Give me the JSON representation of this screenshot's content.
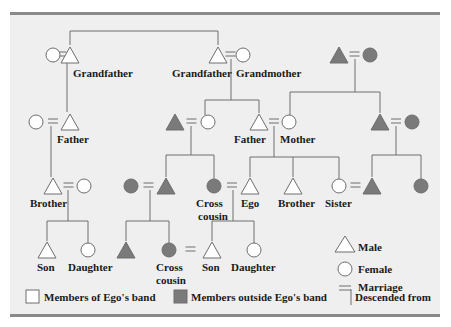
{
  "colors": {
    "panel_bg": "#efefef",
    "rule": "#8a8a8a",
    "line": "#6e6e6e",
    "in_band_fill": "#ffffff",
    "outside_band_fill": "#7a7a7a",
    "stroke": "#6e6e6e",
    "text": "#1a1a1a"
  },
  "people": [
    {
      "id": "gf1_wife",
      "sex": "female",
      "band": "in",
      "label": ""
    },
    {
      "id": "grandfather_paternal_line",
      "sex": "male",
      "band": "in",
      "label": "Grandfather"
    },
    {
      "id": "grandfather",
      "sex": "male",
      "band": "in",
      "label": "Grandfather"
    },
    {
      "id": "grandmother",
      "sex": "female",
      "band": "in",
      "label": "Grandmother"
    },
    {
      "id": "mgp_male",
      "sex": "male",
      "band": "out",
      "label": ""
    },
    {
      "id": "mgp_female",
      "sex": "female",
      "band": "out",
      "label": ""
    },
    {
      "id": "father_left_wife",
      "sex": "female",
      "band": "in",
      "label": ""
    },
    {
      "id": "father_left",
      "sex": "male",
      "band": "in",
      "label": "Father"
    },
    {
      "id": "aunt_husband",
      "sex": "male",
      "band": "out",
      "label": ""
    },
    {
      "id": "aunt",
      "sex": "female",
      "band": "in",
      "label": ""
    },
    {
      "id": "father",
      "sex": "male",
      "band": "in",
      "label": "Father"
    },
    {
      "id": "mother",
      "sex": "female",
      "band": "in",
      "label": "Mother"
    },
    {
      "id": "uncle_right",
      "sex": "male",
      "band": "out",
      "label": ""
    },
    {
      "id": "uncle_right_wife",
      "sex": "female",
      "band": "out",
      "label": ""
    },
    {
      "id": "brother_left",
      "sex": "male",
      "band": "in",
      "label": "Brother"
    },
    {
      "id": "brother_left_wife",
      "sex": "female",
      "band": "in",
      "label": ""
    },
    {
      "id": "cc_male_wife",
      "sex": "female",
      "band": "out",
      "label": ""
    },
    {
      "id": "cc_male",
      "sex": "male",
      "band": "out",
      "label": ""
    },
    {
      "id": "cross_cousin_1",
      "sex": "female",
      "band": "out",
      "label": "Cross cousin"
    },
    {
      "id": "ego",
      "sex": "male",
      "band": "in",
      "label": "Ego"
    },
    {
      "id": "brother",
      "sex": "male",
      "band": "in",
      "label": "Brother"
    },
    {
      "id": "sister",
      "sex": "female",
      "band": "in",
      "label": "Sister"
    },
    {
      "id": "sister_husband",
      "sex": "male",
      "band": "out",
      "label": ""
    },
    {
      "id": "uncle_right_daughter",
      "sex": "female",
      "band": "out",
      "label": ""
    },
    {
      "id": "son_left",
      "sex": "male",
      "band": "in",
      "label": "Son"
    },
    {
      "id": "daughter_left",
      "sex": "female",
      "band": "in",
      "label": "Daughter"
    },
    {
      "id": "cc2_male",
      "sex": "male",
      "band": "out",
      "label": ""
    },
    {
      "id": "cross_cousin_2",
      "sex": "female",
      "band": "out",
      "label": "Cross cousin"
    },
    {
      "id": "son",
      "sex": "male",
      "band": "in",
      "label": "Son"
    },
    {
      "id": "daughter",
      "sex": "female",
      "band": "in",
      "label": "Daughter"
    }
  ],
  "marriages": [
    [
      "gf1_wife",
      "grandfather_paternal_line"
    ],
    [
      "grandfather",
      "grandmother"
    ],
    [
      "mgp_male",
      "mgp_female"
    ],
    [
      "father_left_wife",
      "father_left"
    ],
    [
      "aunt_husband",
      "aunt"
    ],
    [
      "father",
      "mother"
    ],
    [
      "uncle_right",
      "uncle_right_wife"
    ],
    [
      "brother_left",
      "brother_left_wife"
    ],
    [
      "cc_male_wife",
      "cc_male"
    ],
    [
      "cross_cousin_1",
      "ego"
    ],
    [
      "sister",
      "sister_husband"
    ],
    [
      "cross_cousin_2",
      "son"
    ]
  ],
  "legend": {
    "male": "Male",
    "female": "Female",
    "marriage": "Marriage",
    "in_band": "Members of Ego's band",
    "outside_band": "Members outside Ego's band",
    "descended": "Descended from"
  }
}
